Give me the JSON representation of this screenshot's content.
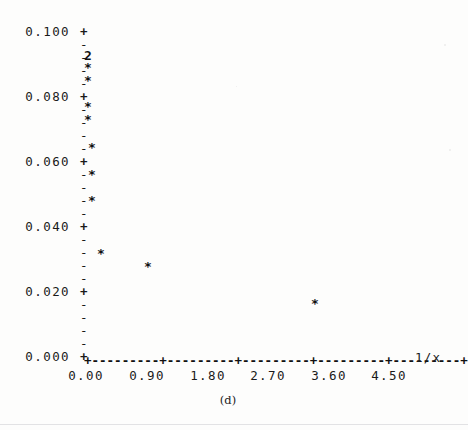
{
  "figure": {
    "caption": "(d)",
    "background_color": "#fdfdfc",
    "ink_color": "#111111"
  },
  "chart_data": {
    "type": "scatter",
    "title": "",
    "subtitle": "",
    "xlabel": "1/x",
    "ylabel": "",
    "xlim": [
      0.0,
      4.5
    ],
    "ylim": [
      0.0,
      0.1
    ],
    "grid": false,
    "legend": null,
    "marker": "*",
    "x_tick_labels": [
      "0.00",
      "0.90",
      "1.80",
      "2.70",
      "3.60",
      "4.50"
    ],
    "x_ticks": [
      0.0,
      0.9,
      1.8,
      2.7,
      3.6,
      4.5
    ],
    "y_tick_labels": [
      "0.100",
      "0.080",
      "0.060",
      "0.040",
      "0.020",
      "0.000"
    ],
    "y_ticks": [
      0.1,
      0.08,
      0.06,
      0.04,
      0.02,
      0.0
    ],
    "y_minor_ticks_between_majors": 4,
    "axis_style": "ascii-dashed",
    "major_tick_glyph": "+",
    "minor_tick_glyph": "-",
    "x_axis_line": "+---------+---------+---------+---------+---------+",
    "points": [
      {
        "x": 0.04,
        "y": 0.092,
        "count": 2,
        "label": "2"
      },
      {
        "x": 0.04,
        "y": 0.088,
        "count": 1
      },
      {
        "x": 0.04,
        "y": 0.084,
        "count": 1
      },
      {
        "x": 0.04,
        "y": 0.076,
        "count": 1
      },
      {
        "x": 0.04,
        "y": 0.072,
        "count": 1
      },
      {
        "x": 0.06,
        "y": 0.064,
        "count": 1
      },
      {
        "x": 0.06,
        "y": 0.056,
        "count": 1
      },
      {
        "x": 0.06,
        "y": 0.048,
        "count": 1
      },
      {
        "x": 0.25,
        "y": 0.032,
        "count": 1
      },
      {
        "x": 0.95,
        "y": 0.028,
        "count": 1
      },
      {
        "x": 3.42,
        "y": 0.017,
        "count": 1
      }
    ],
    "overlap_markers": [
      {
        "x": 0.04,
        "y": 0.092,
        "count": 2,
        "glyph": "2"
      }
    ],
    "n_points_total": 12
  },
  "layout": {
    "y_axis_rows": [
      {
        "label": "0.100",
        "glyph": "+",
        "major": true,
        "top": 25
      },
      {
        "label": "",
        "glyph": "-",
        "major": false,
        "top": 38
      },
      {
        "label": "",
        "glyph": "-",
        "major": false,
        "top": 51
      },
      {
        "label": "",
        "glyph": "-",
        "major": false,
        "top": 64
      },
      {
        "label": "",
        "glyph": "-",
        "major": false,
        "top": 77
      },
      {
        "label": "0.080",
        "glyph": "+",
        "major": true,
        "top": 90
      },
      {
        "label": "",
        "glyph": "-",
        "major": false,
        "top": 103
      },
      {
        "label": "",
        "glyph": "-",
        "major": false,
        "top": 116
      },
      {
        "label": "",
        "glyph": "-",
        "major": false,
        "top": 129
      },
      {
        "label": "",
        "glyph": "-",
        "major": false,
        "top": 142
      },
      {
        "label": "0.060",
        "glyph": "+",
        "major": true,
        "top": 155
      },
      {
        "label": "",
        "glyph": "-",
        "major": false,
        "top": 168
      },
      {
        "label": "",
        "glyph": "-",
        "major": false,
        "top": 181
      },
      {
        "label": "",
        "glyph": "-",
        "major": false,
        "top": 194
      },
      {
        "label": "",
        "glyph": "-",
        "major": false,
        "top": 207
      },
      {
        "label": "0.040",
        "glyph": "+",
        "major": true,
        "top": 220
      },
      {
        "label": "",
        "glyph": "-",
        "major": false,
        "top": 233
      },
      {
        "label": "",
        "glyph": "-",
        "major": false,
        "top": 246
      },
      {
        "label": "",
        "glyph": "-",
        "major": false,
        "top": 259
      },
      {
        "label": "",
        "glyph": "-",
        "major": false,
        "top": 272
      },
      {
        "label": "0.020",
        "glyph": "+",
        "major": true,
        "top": 285
      },
      {
        "label": "",
        "glyph": "-",
        "major": false,
        "top": 298
      },
      {
        "label": "",
        "glyph": "-",
        "major": false,
        "top": 311
      },
      {
        "label": "",
        "glyph": "-",
        "major": false,
        "top": 324
      },
      {
        "label": "",
        "glyph": "-",
        "major": false,
        "top": 337
      },
      {
        "label": "0.000",
        "glyph": "+",
        "major": true,
        "top": 350
      }
    ],
    "x_tick_px": [
      86,
      147,
      208,
      268,
      329,
      389
    ],
    "point_px": [
      {
        "left": 88,
        "top": 55,
        "glyph": "2",
        "overlap": true
      },
      {
        "left": 88,
        "top": 67,
        "glyph": "*",
        "overlap": false
      },
      {
        "left": 88,
        "top": 80,
        "glyph": "*",
        "overlap": false
      },
      {
        "left": 88,
        "top": 106,
        "glyph": "*",
        "overlap": false
      },
      {
        "left": 88,
        "top": 119,
        "glyph": "*",
        "overlap": false
      },
      {
        "left": 92,
        "top": 147,
        "glyph": "*",
        "overlap": false
      },
      {
        "left": 92,
        "top": 174,
        "glyph": "*",
        "overlap": false
      },
      {
        "left": 92,
        "top": 200,
        "glyph": "*",
        "overlap": false
      },
      {
        "left": 101,
        "top": 253,
        "glyph": "*",
        "overlap": false
      },
      {
        "left": 148,
        "top": 266,
        "glyph": "*",
        "overlap": false
      },
      {
        "left": 315,
        "top": 303,
        "glyph": "*",
        "overlap": false
      }
    ]
  }
}
